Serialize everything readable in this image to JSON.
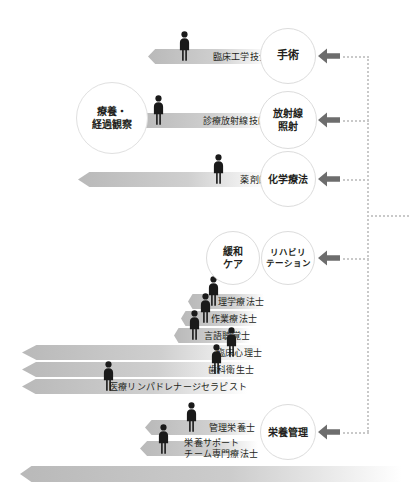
{
  "diagram": {
    "arrow_icon": "left-arrow-icon",
    "person_icon": "person-icon"
  },
  "treatment_nodes": [
    {
      "id": "surgery",
      "lines": [
        "手術"
      ],
      "cx": 288,
      "cy": 56,
      "r": 28,
      "size": "c-big"
    },
    {
      "id": "radiation",
      "lines": [
        "放射線",
        "照射"
      ],
      "cx": 288,
      "cy": 120,
      "r": 29,
      "size": "c-mid"
    },
    {
      "id": "chemotherapy",
      "lines": [
        "化学療法"
      ],
      "cx": 288,
      "cy": 179,
      "r": 28,
      "size": "c-mid"
    },
    {
      "id": "palliative",
      "lines": [
        "緩和",
        "ケア"
      ],
      "cx": 233,
      "cy": 258,
      "r": 27,
      "size": "c-mid"
    },
    {
      "id": "rehab",
      "lines": [
        "リハビリ",
        "テーション"
      ],
      "cx": 288,
      "cy": 258,
      "r": 27,
      "size": "c-sm"
    },
    {
      "id": "nutrition",
      "lines": [
        "栄養管理"
      ],
      "cx": 288,
      "cy": 432,
      "r": 28,
      "size": "c-mid"
    }
  ],
  "observation_node": {
    "id": "observation",
    "lines": [
      "療養・",
      "経過観察"
    ],
    "cx": 112,
    "cy": 118,
    "r": 36
  },
  "role_bars": [
    {
      "id": "clinical-engineer",
      "label": "臨床工学技士",
      "label2": "",
      "x": 148,
      "y": 49,
      "w": 120,
      "px": 176,
      "py": 31
    },
    {
      "id": "radiological-tech",
      "label": "診療放射線技師",
      "label2": "",
      "x": 137,
      "y": 113,
      "w": 130,
      "px": 150,
      "py": 95
    },
    {
      "id": "pharmacist",
      "label": "薬剤師",
      "label2": "",
      "x": 78,
      "y": 172,
      "w": 190,
      "px": 210,
      "py": 154
    },
    {
      "id": "physical-therapist",
      "label": "理学療法士",
      "label2": "",
      "x": 188,
      "y": 294,
      "w": 76,
      "px": 205,
      "py": 276
    },
    {
      "id": "occupational-therapist",
      "label": "作業療法士",
      "label2": "",
      "x": 181,
      "y": 311,
      "w": 76,
      "px": 197,
      "py": 293
    },
    {
      "id": "speech-therapist",
      "label": "言語聴覚士",
      "label2": "",
      "x": 174,
      "y": 328,
      "w": 76,
      "px": 186,
      "py": 310
    },
    {
      "id": "clinical-psychologist",
      "label": "臨床心理士",
      "label2": "",
      "x": 22,
      "y": 345,
      "w": 240,
      "px": 223,
      "py": 327
    },
    {
      "id": "dental-hygienist",
      "label": "歯科衛生士",
      "label2": "",
      "x": 22,
      "y": 362,
      "w": 232,
      "px": 208,
      "py": 344
    },
    {
      "id": "lymph-therapist",
      "label": "医療リンパドレナージセラピスト",
      "label2": "",
      "x": 22,
      "y": 379,
      "w": 225,
      "px": 100,
      "py": 361
    },
    {
      "id": "dietitian",
      "label": "管理栄養士",
      "label2": "",
      "x": 145,
      "y": 420,
      "w": 110,
      "px": 183,
      "py": 402
    },
    {
      "id": "nutrition-support",
      "label": "栄養サポート",
      "label2": "チーム専門療法士",
      "x": 140,
      "y": 441,
      "w": 118,
      "px": 155,
      "py": 424
    }
  ],
  "bottom_bar": {
    "id": "bottom-empty-bar",
    "x": 20,
    "y": 466,
    "w": 382
  },
  "connector": {
    "spine_x": 367,
    "spine_top": 56,
    "spine_bottom": 432,
    "branches": [
      56,
      120,
      179,
      258,
      432
    ],
    "stub_y": 215,
    "stub_right": 409
  },
  "colors": {
    "bar_start": "#b9b9b9",
    "bar_end": "#ffffff",
    "arrow": "#6d6d6d",
    "dotted": "#c9c9c9",
    "text": "#231f20",
    "circle_border": "#dcdcdc",
    "person": "#1a1a1a"
  }
}
